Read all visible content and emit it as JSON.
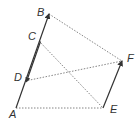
{
  "diagram": {
    "points": {
      "A": {
        "label": "A",
        "x": 16,
        "y": 108
      },
      "B": {
        "label": "B",
        "x": 49,
        "y": 14
      },
      "C": {
        "label": "C",
        "x": 39,
        "y": 41
      },
      "D": {
        "label": "D",
        "x": 25,
        "y": 81
      },
      "E": {
        "label": "E",
        "x": 103,
        "y": 108
      },
      "F": {
        "label": "F",
        "x": 122,
        "y": 61
      }
    },
    "solid_vectors": [
      "AB",
      "EF",
      "CD"
    ],
    "dashed_segments": [
      "AE",
      "BF",
      "CE",
      "DF"
    ],
    "colors": {
      "line": "#333333",
      "dashed": "#666666",
      "label": "#333333"
    }
  }
}
